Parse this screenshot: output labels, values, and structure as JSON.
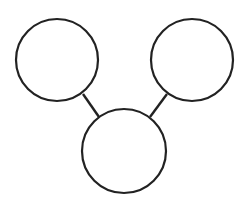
{
  "diagram": {
    "type": "graph",
    "stroke_color": "#222222",
    "background": "#ffffff",
    "nodes": [
      {
        "id": "left",
        "label": ""
      },
      {
        "id": "right",
        "label": ""
      },
      {
        "id": "bottom",
        "label": ""
      }
    ],
    "edges": [
      {
        "from": "left",
        "to": "bottom"
      },
      {
        "from": "right",
        "to": "bottom"
      }
    ]
  }
}
